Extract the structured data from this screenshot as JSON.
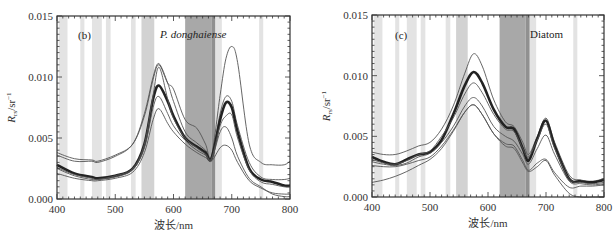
{
  "chart_data": [
    {
      "type": "line",
      "panel_label": "(b)",
      "title": "P. donghaiense",
      "title_italic": true,
      "xlabel": "波长/nm",
      "ylabel": "Rrs/sr-1",
      "ylabel_main": "R",
      "ylabel_sub": "rs",
      "ylabel_unit": "/sr",
      "ylabel_sup": "−1",
      "xlim": [
        400,
        800
      ],
      "ylim": [
        0.0,
        0.015
      ],
      "xticks": [
        400,
        500,
        600,
        700,
        800
      ],
      "xtick_labels": [
        "400",
        "500",
        "600",
        "700",
        "800"
      ],
      "yticks": [
        0.0,
        0.005,
        0.01,
        0.015
      ],
      "ytick_labels": [
        "0.000",
        "0.005",
        "0.010",
        "0.015"
      ],
      "grid": false,
      "shaded_bands": [
        {
          "x0": 403,
          "x1": 418,
          "shade": "light"
        },
        {
          "x0": 440,
          "x1": 447,
          "shade": "light"
        },
        {
          "x0": 460,
          "x1": 477,
          "shade": "light"
        },
        {
          "x0": 484,
          "x1": 492,
          "shade": "light"
        },
        {
          "x0": 527,
          "x1": 535,
          "shade": "light"
        },
        {
          "x0": 545,
          "x1": 567,
          "shade": "medium"
        },
        {
          "x0": 620,
          "x1": 665,
          "shade": "dark"
        },
        {
          "x0": 665,
          "x1": 672,
          "shade": "darker"
        },
        {
          "x0": 672,
          "x1": 683,
          "shade": "light"
        },
        {
          "x0": 747,
          "x1": 754,
          "shade": "light"
        }
      ],
      "x": [
        400,
        430,
        460,
        470,
        500,
        530,
        550,
        565,
        575,
        590,
        600,
        620,
        640,
        655,
        665,
        680,
        690,
        700,
        710,
        730,
        750,
        770,
        790,
        800
      ],
      "series": [
        {
          "name": "upper",
          "style": "thin",
          "values": [
            0.0038,
            0.0033,
            0.0032,
            0.0031,
            0.0036,
            0.0045,
            0.0068,
            0.0098,
            0.011,
            0.0095,
            0.009,
            0.0065,
            0.0058,
            0.0045,
            0.0035,
            0.0085,
            0.0115,
            0.0125,
            0.0112,
            0.0045,
            0.003,
            0.0028,
            0.0028,
            0.0031
          ]
        },
        {
          "name": "high",
          "style": "thin",
          "values": [
            0.0036,
            0.0031,
            0.0031,
            0.003,
            0.0035,
            0.0045,
            0.007,
            0.01,
            0.0111,
            0.0095,
            0.008,
            0.0055,
            0.0046,
            0.004,
            0.0034,
            0.007,
            0.0084,
            0.008,
            0.006,
            0.003,
            0.0018,
            0.0016,
            0.0016,
            0.0017
          ]
        },
        {
          "name": "mean",
          "style": "thick",
          "values": [
            0.0028,
            0.0021,
            0.0018,
            0.0017,
            0.0019,
            0.0025,
            0.0045,
            0.0082,
            0.0093,
            0.008,
            0.0068,
            0.005,
            0.0043,
            0.0038,
            0.0033,
            0.0065,
            0.0079,
            0.0075,
            0.0055,
            0.0025,
            0.0016,
            0.0014,
            0.0011,
            0.0011
          ]
        },
        {
          "name": "mid",
          "style": "thin",
          "values": [
            0.0026,
            0.002,
            0.0017,
            0.0016,
            0.0019,
            0.0025,
            0.0045,
            0.0085,
            0.0108,
            0.0082,
            0.0066,
            0.005,
            0.0042,
            0.0037,
            0.0033,
            0.006,
            0.0068,
            0.0069,
            0.005,
            0.0024,
            0.0014,
            0.0012,
            0.001,
            0.001
          ]
        },
        {
          "name": "low2",
          "style": "thin",
          "values": [
            0.0025,
            0.0019,
            0.0016,
            0.0016,
            0.0018,
            0.0024,
            0.0042,
            0.0075,
            0.0084,
            0.007,
            0.006,
            0.0048,
            0.004,
            0.0036,
            0.0032,
            0.0055,
            0.0059,
            0.005,
            0.0035,
            0.0017,
            0.001,
            0.0004,
            0.0002,
            0.0002
          ]
        },
        {
          "name": "lower",
          "style": "thin",
          "values": [
            0.0021,
            0.0017,
            0.0015,
            0.0015,
            0.0017,
            0.0022,
            0.0038,
            0.0065,
            0.0074,
            0.0062,
            0.0055,
            0.0045,
            0.0038,
            0.0034,
            0.0031,
            0.0042,
            0.0044,
            0.004,
            0.003,
            0.0015,
            0.0009,
            0.0005,
            0.0004,
            0.0004
          ]
        }
      ]
    },
    {
      "type": "line",
      "panel_label": "(c)",
      "title": "Diatom",
      "title_italic": false,
      "xlabel": "波长/nm",
      "ylabel": "Rrs/sr-1",
      "ylabel_main": "R",
      "ylabel_sub": "rs",
      "ylabel_unit": "/sr",
      "ylabel_sup": "−1",
      "xlim": [
        400,
        800
      ],
      "ylim": [
        0.0,
        0.015
      ],
      "xticks": [
        400,
        500,
        600,
        700,
        800
      ],
      "xtick_labels": [
        "400",
        "500",
        "600",
        "700",
        "800"
      ],
      "yticks": [
        0.0,
        0.005,
        0.01,
        0.015
      ],
      "ytick_labels": [
        "0.000",
        "0.005",
        "0.010",
        "0.015"
      ],
      "grid": false,
      "shaded_bands": [
        {
          "x0": 403,
          "x1": 418,
          "shade": "light"
        },
        {
          "x0": 440,
          "x1": 447,
          "shade": "light"
        },
        {
          "x0": 460,
          "x1": 477,
          "shade": "light"
        },
        {
          "x0": 484,
          "x1": 492,
          "shade": "light"
        },
        {
          "x0": 527,
          "x1": 535,
          "shade": "light"
        },
        {
          "x0": 545,
          "x1": 565,
          "shade": "medium"
        },
        {
          "x0": 620,
          "x1": 665,
          "shade": "dark"
        },
        {
          "x0": 665,
          "x1": 672,
          "shade": "darker"
        },
        {
          "x0": 672,
          "x1": 683,
          "shade": "light"
        },
        {
          "x0": 747,
          "x1": 754,
          "shade": "light"
        }
      ],
      "x": [
        400,
        420,
        440,
        460,
        480,
        500,
        520,
        540,
        560,
        575,
        590,
        610,
        630,
        645,
        660,
        670,
        685,
        700,
        715,
        740,
        760,
        780,
        800
      ],
      "series": [
        {
          "name": "upper",
          "style": "thin",
          "values": [
            0.0037,
            0.0035,
            0.0035,
            0.0038,
            0.0042,
            0.0045,
            0.0056,
            0.0075,
            0.0102,
            0.0118,
            0.0108,
            0.008,
            0.0062,
            0.0058,
            0.0045,
            0.0035,
            0.005,
            0.0065,
            0.0045,
            0.0018,
            0.0014,
            0.0013,
            0.0015
          ]
        },
        {
          "name": "mean",
          "style": "thick",
          "values": [
            0.0033,
            0.0029,
            0.0027,
            0.0031,
            0.0035,
            0.0037,
            0.0047,
            0.0068,
            0.0092,
            0.0103,
            0.0094,
            0.0072,
            0.0058,
            0.0056,
            0.004,
            0.003,
            0.0048,
            0.0063,
            0.0042,
            0.0015,
            0.0013,
            0.0012,
            0.0014
          ]
        },
        {
          "name": "high",
          "style": "thin",
          "values": [
            0.0031,
            0.0028,
            0.0027,
            0.003,
            0.0035,
            0.0038,
            0.005,
            0.0065,
            0.0085,
            0.0094,
            0.0086,
            0.0068,
            0.0056,
            0.0054,
            0.004,
            0.0033,
            0.0047,
            0.006,
            0.004,
            0.0015,
            0.0012,
            0.0011,
            0.0012
          ]
        },
        {
          "name": "mid",
          "style": "thin",
          "values": [
            0.0029,
            0.0027,
            0.0026,
            0.0028,
            0.0033,
            0.0036,
            0.0045,
            0.0058,
            0.0075,
            0.0082,
            0.0075,
            0.0058,
            0.005,
            0.0046,
            0.0035,
            0.0027,
            0.004,
            0.0051,
            0.0035,
            0.0013,
            0.0011,
            0.001,
            0.0011
          ]
        },
        {
          "name": "low2",
          "style": "thin",
          "values": [
            0.0026,
            0.0025,
            0.0025,
            0.0027,
            0.003,
            0.0033,
            0.0042,
            0.0055,
            0.007,
            0.0076,
            0.0068,
            0.0052,
            0.0044,
            0.0042,
            0.003,
            0.0022,
            0.0028,
            0.0031,
            0.002,
            0.0008,
            0.0009,
            0.0009,
            0.001
          ]
        },
        {
          "name": "lower",
          "style": "thin",
          "values": [
            0.0012,
            0.0014,
            0.0017,
            0.0021,
            0.0026,
            0.0031,
            0.004,
            0.0054,
            0.007,
            0.0076,
            0.0068,
            0.0052,
            0.0042,
            0.004,
            0.0028,
            0.0021,
            0.0025,
            0.003,
            0.0018,
            0.0003,
            0.0,
            0.0,
            0.0
          ]
        }
      ]
    }
  ],
  "colors": {
    "band_light": "#e3e3e3",
    "band_medium": "#d2d2d2",
    "band_dark": "#a8a8a8",
    "band_darker": "#909090",
    "line_thin": "#555555",
    "line_thick": "#222222",
    "axis": "#333333"
  }
}
